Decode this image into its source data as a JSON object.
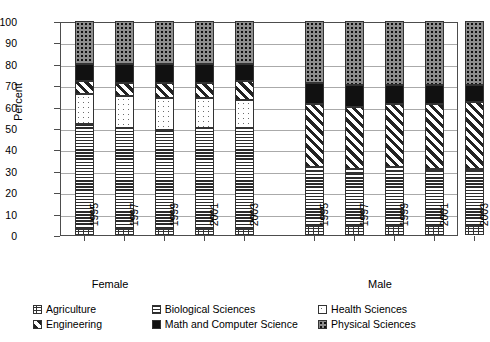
{
  "chart_data": {
    "type": "bar",
    "subtype": "stacked-percent",
    "title": "",
    "xlabel": "",
    "ylabel": "Percent",
    "ylim": [
      0,
      100
    ],
    "ytick_step": 10,
    "yticks": [
      100,
      90,
      80,
      70,
      60,
      50,
      40,
      30,
      20,
      10,
      0
    ],
    "grid": true,
    "legend_position": "bottom",
    "groups": [
      "Female",
      "Male"
    ],
    "categories": [
      "1995",
      "1997",
      "1999",
      "2001",
      "2003"
    ],
    "series": [
      {
        "name": "Agriculture",
        "pattern": "brick-dotted",
        "female": [
          3,
          3,
          3,
          3,
          3
        ],
        "male": [
          4,
          4,
          4,
          4,
          4
        ]
      },
      {
        "name": "Biological Sciences",
        "pattern": "horizontal-lines",
        "female": [
          49,
          47,
          46,
          47,
          47
        ],
        "male": [
          26,
          25,
          26,
          26,
          26
        ]
      },
      {
        "name": "Health Sciences",
        "pattern": "sparse-dots",
        "female": [
          14,
          15,
          15,
          14,
          13
        ],
        "male": [
          2,
          2,
          2,
          1,
          1
        ]
      },
      {
        "name": "Engineering",
        "pattern": "diagonal-stripes",
        "female": [
          6,
          6,
          7,
          7,
          8
        ],
        "male": [
          29,
          29,
          29,
          30,
          31
        ]
      },
      {
        "name": "Math and Computer Science",
        "pattern": "solid-black",
        "female": [
          8,
          9,
          9,
          9,
          9
        ],
        "male": [
          10,
          10,
          9,
          9,
          8
        ]
      },
      {
        "name": "Physical Sciences",
        "pattern": "dark-dotted",
        "female": [
          20,
          20,
          20,
          20,
          20
        ],
        "male": [
          29,
          30,
          30,
          30,
          30
        ]
      }
    ],
    "female_stack_tops": {
      "agriculture": [
        3,
        3,
        3,
        3,
        3
      ],
      "biological": [
        52,
        50,
        49,
        50,
        50
      ],
      "health": [
        66,
        65,
        64,
        64,
        63
      ],
      "engineering": [
        72,
        71,
        71,
        71,
        72
      ],
      "mathcs": [
        80,
        80,
        80,
        80,
        80
      ],
      "physical": [
        100,
        100,
        100,
        100,
        100
      ]
    },
    "male_stack_tops": {
      "agriculture": [
        4,
        4,
        4,
        4,
        4
      ],
      "biological": [
        30,
        29,
        30,
        30,
        30
      ],
      "health": [
        32,
        31,
        32,
        31,
        31
      ],
      "engineering": [
        61,
        60,
        61,
        61,
        62
      ],
      "mathcs": [
        71,
        70,
        70,
        70,
        70
      ],
      "physical": [
        100,
        100,
        100,
        100,
        100
      ]
    }
  },
  "axis": {
    "y_title": "Percent",
    "y_ticks": [
      "100",
      "90",
      "80",
      "70",
      "60",
      "50",
      "40",
      "30",
      "20",
      "10",
      "0"
    ],
    "group_female": "Female",
    "group_male": "Male",
    "x_labels_female": [
      "1995",
      "1997",
      "1999",
      "2001",
      "2003"
    ],
    "x_labels_male": [
      "1995",
      "1997",
      "1999",
      "2001",
      "2003"
    ]
  },
  "legend": {
    "items": [
      {
        "label": "Agriculture",
        "key": "agriculture"
      },
      {
        "label": "Biological Sciences",
        "key": "biological"
      },
      {
        "label": "Health Sciences",
        "key": "health"
      },
      {
        "label": "Engineering",
        "key": "engineering"
      },
      {
        "label": "Math and Computer Science",
        "key": "mathcs"
      },
      {
        "label": "Physical Sciences",
        "key": "physical"
      }
    ]
  },
  "colors": {
    "axis": "#4d4d4d",
    "grid": "#aaaaaa",
    "ink": "#000000",
    "mathcs_fill": "#111111",
    "physical_fill": "#8d8d8d",
    "background": "#ffffff"
  }
}
